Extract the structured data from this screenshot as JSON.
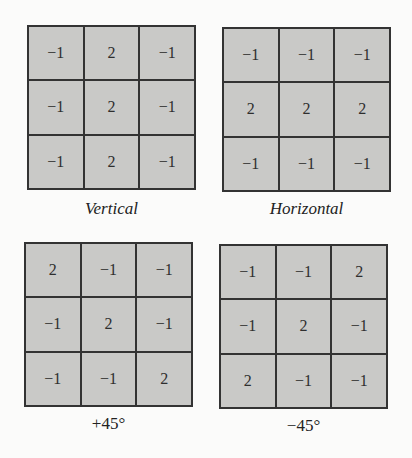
{
  "kernels": [
    {
      "name": "Vertical",
      "label": "Vertical",
      "italic": true,
      "values": [
        "−1",
        "2",
        "−1",
        "−1",
        "2",
        "−1",
        "−1",
        "2",
        "−1"
      ]
    },
    {
      "name": "Horizontal",
      "label": "Horizontal",
      "italic": true,
      "values": [
        "−1",
        "−1",
        "−1",
        "2",
        "2",
        "2",
        "−1",
        "−1",
        "−1"
      ]
    },
    {
      "name": "Plus45",
      "label": "+45°",
      "italic": false,
      "values": [
        "2",
        "−1",
        "−1",
        "−1",
        "2",
        "−1",
        "−1",
        "−1",
        "2"
      ]
    },
    {
      "name": "Minus45",
      "label": "−45°",
      "italic": false,
      "values": [
        "−1",
        "−1",
        "2",
        "−1",
        "2",
        "−1",
        "2",
        "−1",
        "−1"
      ]
    }
  ],
  "colors": {
    "cell_fill": "#c9c9c7",
    "grid_line": "#333333",
    "background": "#fbfbfa"
  }
}
